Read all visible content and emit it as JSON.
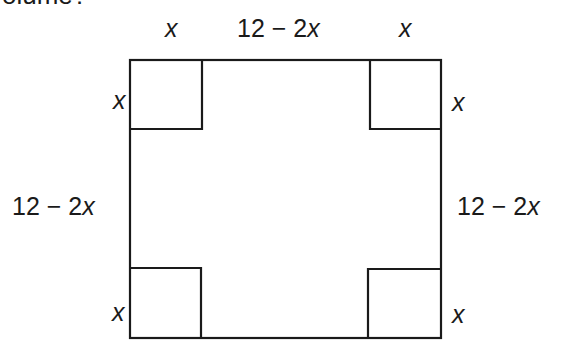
{
  "question": {
    "clipped_text": "olume?"
  },
  "diagram": {
    "outer_square": {
      "x": 130,
      "y": 60,
      "width": 311,
      "height": 278
    },
    "corner_size": 71,
    "stroke_color": "#1a1a1a",
    "labels": {
      "top_left_corner": "x",
      "top_middle": "12 − 2x",
      "top_right_corner": "x",
      "left_top_corner": "x",
      "left_middle": "12 − 2x",
      "left_bottom_corner": "x",
      "right_top_corner": "x",
      "right_middle": "12 − 2x",
      "right_bottom_corner": "x"
    }
  }
}
